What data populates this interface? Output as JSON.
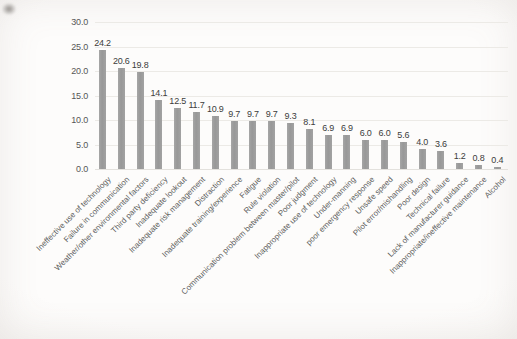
{
  "figure": {
    "background_color": "#fdfcfb",
    "bar_color": "#9b9b9b",
    "grid_color": "#eceae6",
    "axis_text_color": "#565656",
    "value_text_color": "#3c3c3c"
  },
  "chart_data": {
    "type": "bar",
    "title": "",
    "xlabel": "",
    "ylabel": "",
    "categories": [
      "Ineffective use of technology",
      "Failure in communication",
      "Weather/other environmental factors",
      "Third party deficiency",
      "Inadequate lookout",
      "Inadequate risk management",
      "Distraction",
      "Inadequate training/experience",
      "Fatigue",
      "Rule violation",
      "Communication problem between master/pilot",
      "Poor judgment",
      "Inappropriate use of technology",
      "Under-manning",
      "poor emergency response",
      "Unsafe speed",
      "Pilot error/mishandling",
      "Poor design",
      "Technical failure",
      "Lack of manufacturer guidance",
      "Inappropriate/ineffective maintenance",
      "Alcohol"
    ],
    "values": [
      24.2,
      20.6,
      19.8,
      14.1,
      12.5,
      11.7,
      10.9,
      9.7,
      9.7,
      9.7,
      9.3,
      8.1,
      6.9,
      6.9,
      6.0,
      6.0,
      5.6,
      4.0,
      3.6,
      1.2,
      0.8,
      0.4
    ],
    "value_labels_shown": true,
    "ylim": [
      0,
      30
    ],
    "ytick_values": [
      0,
      5,
      10,
      15,
      20,
      25,
      30
    ],
    "ytick_labels": [
      "0.0",
      "5.0",
      "10.0",
      "15.0",
      "20.0",
      "25.0",
      "30.0"
    ],
    "grid": "horizontal",
    "legend": "none",
    "x_label_rotation_deg": 45
  }
}
